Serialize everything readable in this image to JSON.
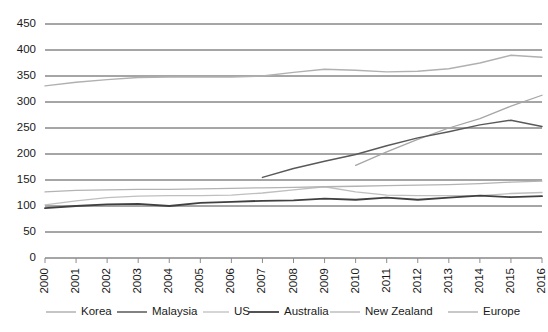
{
  "chart_data": {
    "type": "line",
    "title": "",
    "subtitle": "",
    "xlabel": "",
    "ylabel": "",
    "grid": true,
    "legend_position": "bottom",
    "ylim": [
      0,
      450
    ],
    "yticks": [
      0,
      50,
      100,
      150,
      200,
      250,
      300,
      350,
      400,
      450
    ],
    "x": [
      2000,
      2001,
      2002,
      2003,
      2004,
      2005,
      2006,
      2007,
      2008,
      2009,
      2010,
      2011,
      2012,
      2013,
      2014,
      2015,
      2016
    ],
    "xtick_labels": [
      "2000",
      "2001",
      "2002",
      "2003",
      "2004",
      "2005",
      "2006",
      "2007",
      "2008",
      "2009",
      "2010",
      "2011",
      "2012",
      "2013",
      "2014",
      "2015",
      "2016"
    ],
    "series": [
      {
        "name": "Korea",
        "color": "#a6a6a6",
        "width": 1.3,
        "start_index": 10,
        "values": [
          null,
          null,
          null,
          null,
          null,
          null,
          null,
          null,
          null,
          null,
          178,
          204,
          228,
          250,
          268,
          292,
          313
        ]
      },
      {
        "name": "Malaysia",
        "color": "#595959",
        "width": 1.5,
        "start_index": 7,
        "values": [
          null,
          null,
          null,
          null,
          null,
          null,
          null,
          155,
          172,
          186,
          199,
          216,
          231,
          243,
          256,
          265,
          253
        ]
      },
      {
        "name": "US",
        "color": "#bfbfbf",
        "width": 1.3,
        "start_index": 0,
        "values": [
          102,
          110,
          116,
          119,
          120,
          120,
          121,
          125,
          131,
          137,
          127,
          121,
          120,
          120,
          120,
          124,
          126
        ]
      },
      {
        "name": "Australia",
        "color": "#404040",
        "width": 1.8,
        "start_index": 0,
        "values": [
          96,
          100,
          103,
          104,
          100,
          106,
          108,
          110,
          111,
          114,
          112,
          116,
          112,
          116,
          120,
          117,
          119
        ]
      },
      {
        "name": "New Zealand",
        "color": "#b3b3b3",
        "width": 1.3,
        "start_index": 0,
        "values": [
          127,
          130,
          131,
          132,
          132,
          133,
          134,
          135,
          136,
          137,
          138,
          139,
          140,
          141,
          143,
          146,
          148
        ]
      },
      {
        "name": "Europe",
        "color": "#b0b0b0",
        "width": 1.4,
        "start_index": 0,
        "values": [
          331,
          338,
          343,
          347,
          348,
          348,
          348,
          350,
          357,
          363,
          361,
          358,
          359,
          364,
          375,
          390,
          386
        ]
      }
    ]
  },
  "legend": {
    "items": [
      {
        "label": "Korea"
      },
      {
        "label": "Malaysia"
      },
      {
        "label": "US"
      },
      {
        "label": "Australia"
      },
      {
        "label": "New Zealand"
      },
      {
        "label": "Europe"
      }
    ]
  }
}
